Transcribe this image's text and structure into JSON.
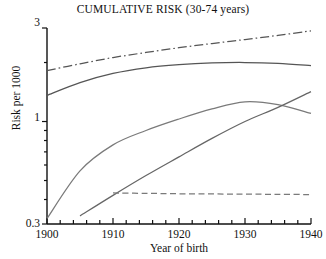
{
  "chart_data": {
    "type": "line",
    "title": "CUMULATIVE RISK (30-74 years)",
    "xlabel": "Year of birth",
    "ylabel": "Risk per 1000",
    "yscale": "log",
    "xlim": [
      1900,
      1940
    ],
    "ylim": [
      0.3,
      3
    ],
    "grid": false,
    "legend": "none",
    "ytick_labels": [
      "3",
      "1",
      "0.3"
    ],
    "ytick_values": [
      3,
      1,
      0.3
    ],
    "xtick_labels": [
      "1900",
      "1910",
      "1920",
      "1930",
      "1940"
    ],
    "xtick_values": [
      1900,
      1910,
      1920,
      1930,
      1940
    ],
    "xminor_step": 2,
    "series": [
      {
        "name": "series-1-dashdot",
        "style": "dash-dot",
        "color": "#555555",
        "x": [
          1900,
          1905,
          1910,
          1915,
          1920,
          1925,
          1930,
          1935,
          1940
        ],
        "y": [
          1.82,
          1.97,
          2.12,
          2.25,
          2.38,
          2.5,
          2.62,
          2.75,
          2.9
        ]
      },
      {
        "name": "series-2-solid-upper",
        "style": "solid",
        "color": "#555555",
        "x": [
          1900,
          1905,
          1910,
          1915,
          1920,
          1925,
          1930,
          1935,
          1940
        ],
        "y": [
          1.36,
          1.58,
          1.76,
          1.88,
          1.95,
          1.99,
          2.0,
          1.98,
          1.93
        ]
      },
      {
        "name": "series-3-solid-middle",
        "style": "solid",
        "color": "#7a7a7a",
        "x": [
          1900,
          1905,
          1910,
          1915,
          1920,
          1925,
          1930,
          1935,
          1940
        ],
        "y": [
          0.32,
          0.56,
          0.76,
          0.9,
          1.03,
          1.16,
          1.26,
          1.22,
          1.1
        ]
      },
      {
        "name": "series-4-solid-lower",
        "style": "solid",
        "color": "#666666",
        "x": [
          1905,
          1910,
          1915,
          1920,
          1925,
          1930,
          1935,
          1940
        ],
        "y": [
          0.33,
          0.42,
          0.53,
          0.66,
          0.82,
          1.0,
          1.18,
          1.42
        ]
      },
      {
        "name": "series-5-dashed-flat",
        "style": "dashed",
        "color": "#7a7a7a",
        "x": [
          1910,
          1915,
          1920,
          1925,
          1930,
          1935,
          1940
        ],
        "y": [
          0.432,
          0.43,
          0.428,
          0.427,
          0.426,
          0.425,
          0.424
        ]
      }
    ]
  },
  "axes": {
    "title": "CUMULATIVE RISK (30-74 years)",
    "y_axis_label": "Risk per 1000",
    "x_axis_label": "Year of birth"
  }
}
